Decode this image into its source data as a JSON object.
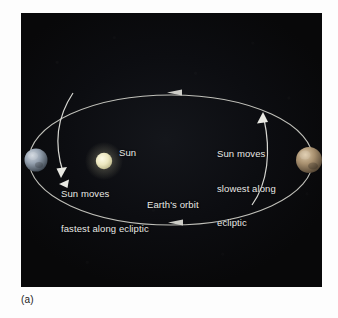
{
  "figure": {
    "caption": "(a)",
    "panel_background": "#0a0b0e"
  },
  "scene": {
    "sun": {
      "label": "Sun",
      "color": "#e8e4c0"
    },
    "orbit": {
      "label": "Earth's orbit",
      "color": "#cfcfc8",
      "direction": "counterclockwise"
    },
    "earth_perihelion": {
      "name": "earth-left",
      "color": "#9aa6b4"
    },
    "earth_aphelion": {
      "name": "earth-right",
      "color": "#a89274"
    },
    "annotations": {
      "left": {
        "line1": "Sun moves",
        "line2": "fastest along ecliptic"
      },
      "right": {
        "line1": "Sun moves",
        "line2": "slowest along",
        "line3": "ecliptic"
      }
    }
  }
}
